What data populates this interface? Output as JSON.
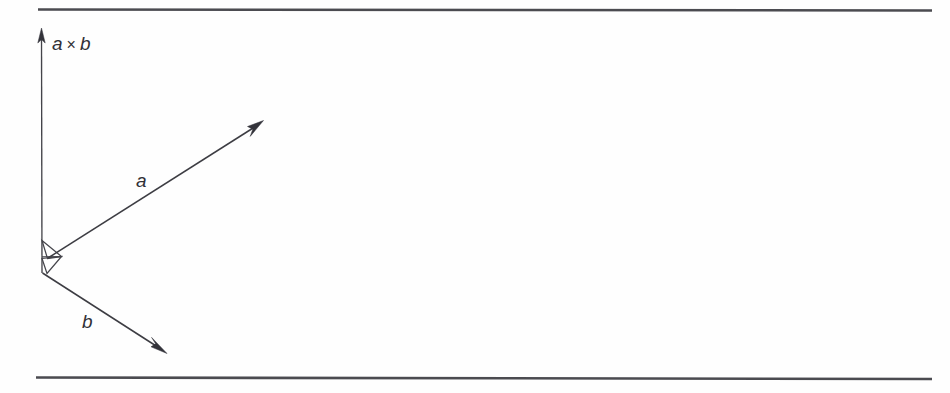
{
  "figure": {
    "background_color": "#fefefe",
    "ink_color": "#3c3c42",
    "labels": {
      "cross_product": "a",
      "cross_product_operator": "×",
      "cross_product_operand": "b",
      "cross_product_full": "a × b",
      "vector_a": "a",
      "vector_b": "b"
    },
    "rules": [
      {
        "name": "top-rule",
        "x1": 38,
        "y1": 9,
        "x2": 932,
        "y2": 10
      },
      {
        "name": "bottom-rule",
        "x1": 36,
        "y1": 377,
        "x2": 932,
        "y2": 379
      }
    ],
    "axis": {
      "name": "cross-product-axis",
      "x1": 41,
      "y1": 32,
      "x2": 42,
      "y2": 273,
      "arrow_tip_x": 41,
      "arrow_tip_y": 29,
      "label_x": 52,
      "label_y": 50
    },
    "vectors": [
      {
        "name": "vector-a",
        "label": "a",
        "x1": 48,
        "y1": 258,
        "x2": 262,
        "y2": 122,
        "label_x": 136,
        "label_y": 187
      },
      {
        "name": "vector-b",
        "label": "b",
        "x1": 42,
        "y1": 273,
        "x2": 166,
        "y2": 353,
        "label_x": 82,
        "label_y": 328
      }
    ],
    "angle_markers": [
      {
        "name": "right-angle-marker-axis-a",
        "points": "42,241 62,256 48,258 42,241"
      },
      {
        "name": "right-angle-marker-axis-b",
        "points": "42,258 62,256 48,273 42,258"
      }
    ]
  }
}
